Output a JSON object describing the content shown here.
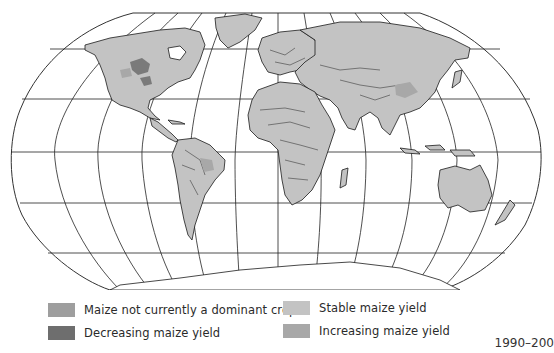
{
  "figure": {
    "type": "world-map",
    "projection": "Robinson-like"
  },
  "legend": {
    "items": [
      {
        "id": "not-dominant",
        "label": "Maize not currently a dominant crop",
        "color": "#9e9e9e"
      },
      {
        "id": "stable",
        "label": "Stable maize yield",
        "color": "#c3c3c3"
      },
      {
        "id": "decreasing",
        "label": "Decreasing maize yield",
        "color": "#6e6e6e"
      },
      {
        "id": "increasing",
        "label": "Increasing maize yield",
        "color": "#a8a8a8"
      }
    ]
  },
  "cut_off_text": "1990–200"
}
